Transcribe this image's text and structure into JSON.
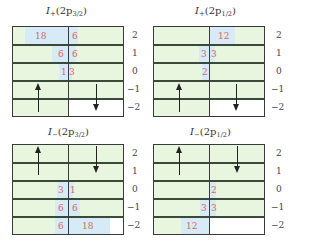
{
  "colors": {
    "cell_fill": "#e8f6e0",
    "highlight_fill": "#d6eaf7",
    "number_color": "#d8685a",
    "grid_line": "#3a3a3a"
  },
  "m_labels": [
    "2",
    "1",
    "0",
    "−1",
    "−2"
  ],
  "panels": [
    {
      "id": "top-left",
      "title": {
        "I": "I",
        "sign": "+",
        "open": "(2p",
        "sub": "3/2",
        "close": ")"
      },
      "numbers": [
        {
          "row": "2",
          "left": "18",
          "right": "6"
        },
        {
          "row": "1",
          "left": "6",
          "right": "6"
        },
        {
          "row": "0",
          "left": "1",
          "right": "3"
        }
      ],
      "arrows": {
        "up": "spin-up",
        "down": "spin-down"
      }
    },
    {
      "id": "top-right",
      "title": {
        "I": "I",
        "sign": "+",
        "open": "(2p",
        "sub": "1/2",
        "close": ")"
      },
      "numbers": [
        {
          "row": "2",
          "left": "",
          "right": "12"
        },
        {
          "row": "1",
          "left": "3",
          "right": "3"
        },
        {
          "row": "0",
          "left": "2",
          "right": ""
        }
      ],
      "arrows": {
        "up": "spin-up",
        "down": "spin-down"
      }
    },
    {
      "id": "bottom-left",
      "title": {
        "I": "I",
        "sign": "−",
        "open": "(2p",
        "sub": "3/2",
        "close": ")"
      },
      "numbers": [
        {
          "row": "0",
          "left": "3",
          "right": "1"
        },
        {
          "row": "-1",
          "left": "6",
          "right": "6"
        },
        {
          "row": "-2",
          "left": "6",
          "right": "18"
        }
      ],
      "arrows": {
        "up": "spin-up",
        "down": "spin-down"
      }
    },
    {
      "id": "bottom-right",
      "title": {
        "I": "I",
        "sign": "−",
        "open": "(2p",
        "sub": "1/2",
        "close": ")"
      },
      "numbers": [
        {
          "row": "0",
          "left": "",
          "right": "2"
        },
        {
          "row": "-1",
          "left": "3",
          "right": "3"
        },
        {
          "row": "-2",
          "left": "12",
          "right": ""
        }
      ],
      "arrows": {
        "up": "spin-up",
        "down": "spin-down"
      }
    }
  ]
}
